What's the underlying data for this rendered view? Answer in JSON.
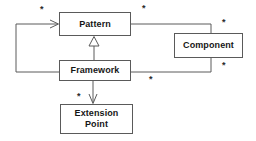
{
  "diagram": {
    "type": "uml-class-diagram",
    "width": 256,
    "height": 141,
    "background_color": "#ffffff",
    "line_color": "#5a5a5a",
    "text_color": "#161616",
    "classes": [
      {
        "id": "pattern",
        "name": "Pattern",
        "x": 59,
        "y": 12,
        "width": 72,
        "height": 24
      },
      {
        "id": "component",
        "name": "Component",
        "x": 174,
        "y": 33,
        "width": 69,
        "height": 25
      },
      {
        "id": "framework",
        "name": "Framework",
        "x": 59,
        "y": 60,
        "width": 72,
        "height": 21
      },
      {
        "id": "extension-point",
        "name": "Extension\nPoint",
        "x": 60,
        "y": 104,
        "width": 73,
        "height": 30
      }
    ],
    "relationships": [
      {
        "id": "framework-uses-pattern",
        "from": "framework",
        "to": "pattern",
        "kind": "association-directed",
        "arrow": "open-arrowhead"
      },
      {
        "id": "framework-inherits-pattern",
        "from": "framework",
        "to": "pattern",
        "kind": "generalization",
        "arrow": "hollow-triangle"
      },
      {
        "id": "pattern-component",
        "from": "pattern",
        "to": "component",
        "kind": "association",
        "arrow": "none"
      },
      {
        "id": "framework-component",
        "from": "framework",
        "to": "component",
        "kind": "association",
        "arrow": "none"
      },
      {
        "id": "framework-extension-point",
        "from": "framework",
        "to": "extension-point",
        "kind": "association-directed",
        "arrow": "open-arrowhead"
      }
    ],
    "multiplicities": [
      {
        "id": "m1",
        "label": "*",
        "x": 40,
        "y": 5,
        "relationship": "framework-uses-pattern"
      },
      {
        "id": "m2",
        "label": "*",
        "x": 142,
        "y": 4,
        "relationship": "pattern-component"
      },
      {
        "id": "m3",
        "label": "*",
        "x": 222,
        "y": 18,
        "relationship": "pattern-component"
      },
      {
        "id": "m4",
        "label": "*",
        "x": 222,
        "y": 61,
        "relationship": "framework-component"
      },
      {
        "id": "m5",
        "label": "*",
        "x": 149,
        "y": 75,
        "relationship": "framework-component"
      },
      {
        "id": "m6",
        "label": "*",
        "x": 77,
        "y": 92,
        "relationship": "framework-extension-point"
      }
    ]
  }
}
